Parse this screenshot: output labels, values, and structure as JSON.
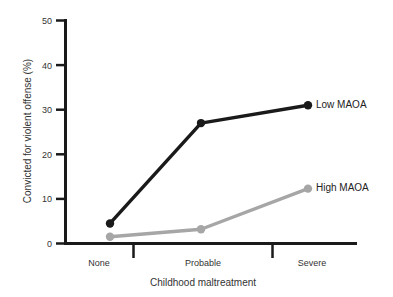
{
  "chart_data": {
    "type": "line",
    "title": "",
    "xlabel": "Childhood maltreatment",
    "ylabel": "Convicted for violent offense (%)",
    "categories": [
      "None",
      "Probable",
      "Severe"
    ],
    "xticklabels": [
      "None",
      "Probable",
      "Severe"
    ],
    "yticklabels": [
      "0",
      "10",
      "20",
      "30",
      "40",
      "50"
    ],
    "yticks": [
      0,
      10,
      20,
      30,
      40,
      50
    ],
    "ylim": [
      0,
      50
    ],
    "grid": false,
    "legend_position": "inline-right-of-last-point",
    "series": [
      {
        "name": "Low MAOA",
        "values": [
          4.5,
          27,
          31
        ],
        "color": "#1a1a1a",
        "marker": "circle",
        "label": "Low MAOA"
      },
      {
        "name": "High MAOA",
        "values": [
          1.5,
          3.2,
          12.3
        ],
        "color": "#a6a6a6",
        "marker": "circle",
        "label": "High MAOA"
      }
    ]
  },
  "axes": {
    "y_title": "Convicted for violent offense (%)",
    "x_title": "Childhood maltreatment",
    "y_labels": {
      "t0": "0",
      "t1": "10",
      "t2": "20",
      "t3": "30",
      "t4": "40",
      "t5": "50"
    },
    "x_labels": {
      "c0": "None",
      "c1": "Probable",
      "c2": "Severe"
    }
  },
  "legend": {
    "low": "Low MAOA",
    "high": "High MAOA"
  },
  "colors": {
    "low_series": "#1a1a1a",
    "high_series": "#a6a6a6",
    "axis": "#1a1a1a",
    "text": "#333333",
    "background": "#ffffff"
  }
}
